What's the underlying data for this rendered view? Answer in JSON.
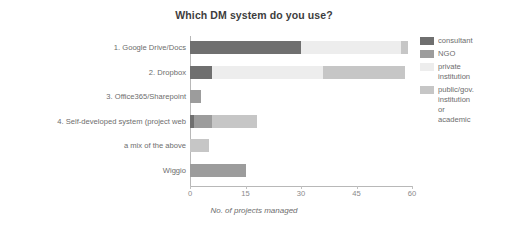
{
  "chart_data": {
    "type": "bar",
    "orientation": "horizontal",
    "stacked": true,
    "title": "Which DM system do you use?",
    "xlabel": "No. of projects managed",
    "ylabel": "",
    "xlim": [
      0,
      60
    ],
    "xticks": [
      0,
      15,
      30,
      45,
      60
    ],
    "xticklabels": [
      "0",
      "15",
      "30",
      "45",
      "60"
    ],
    "grid": false,
    "legend_position": "right",
    "categories": [
      "1. Google Drive/Docs",
      "2. Dropbox",
      "3. Office365/Sharepoint",
      "4. Self-developed system (project web",
      "a mix of the above",
      "Wiggio"
    ],
    "series": [
      {
        "name": "consultant",
        "color": "#6f6f6f",
        "values": [
          30,
          6,
          0,
          1,
          0,
          0
        ]
      },
      {
        "name": "NGO",
        "color": "#9c9c9c",
        "values": [
          0,
          0,
          3,
          5,
          0,
          15
        ]
      },
      {
        "name": "private institution",
        "color": "#ededed",
        "values": [
          27,
          30,
          0,
          0,
          0,
          0
        ]
      },
      {
        "name": "public/gov. institution or academic",
        "color": "#c6c6c6",
        "values": [
          2,
          22,
          0,
          12,
          5,
          0
        ]
      }
    ],
    "totals": [
      59,
      58,
      3,
      18,
      5,
      15
    ]
  },
  "legend": {
    "entries": [
      {
        "label_lines": [
          "consultant"
        ],
        "color": "#6f6f6f"
      },
      {
        "label_lines": [
          "NGO"
        ],
        "color": "#9c9c9c"
      },
      {
        "label_lines": [
          "private",
          "institution"
        ],
        "color": "#ededed"
      },
      {
        "label_lines": [
          "public/gov.",
          "institution",
          "or",
          "academic"
        ],
        "color": "#c6c6c6"
      }
    ]
  }
}
